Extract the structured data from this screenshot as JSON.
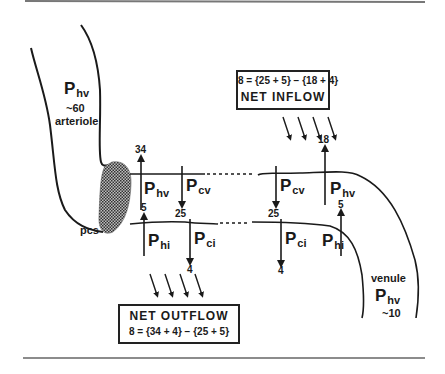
{
  "diagram": {
    "arteriole": {
      "pressure_label": "P",
      "pressure_sub": "hv",
      "value": "~60",
      "name": "arteriole"
    },
    "venule": {
      "name": "venule",
      "pressure_label": "P",
      "pressure_sub": "hv",
      "value": "~10"
    },
    "sphincter_label": "pcs",
    "arterial_end": {
      "P_hv": {
        "label": "P",
        "sub": "hv",
        "value": "34"
      },
      "P_cv": {
        "label": "P",
        "sub": "cv",
        "value": "25"
      },
      "P_hi": {
        "label": "P",
        "sub": "hi",
        "value": "5"
      },
      "P_ci": {
        "label": "P",
        "sub": "ci",
        "value": "4"
      }
    },
    "venous_end": {
      "P_cv": {
        "label": "P",
        "sub": "cv",
        "value": "25"
      },
      "P_hv": {
        "label": "P",
        "sub": "hv",
        "value": "18"
      },
      "P_ci": {
        "label": "P",
        "sub": "ci",
        "value": "4"
      },
      "P_hi": {
        "label": "P",
        "sub": "hi",
        "value": "5"
      }
    },
    "net_inflow": {
      "equation": "8 = {25 + 5} − {18 + 4}",
      "title": "NET INFLOW"
    },
    "net_outflow": {
      "title": "NET OUTFLOW",
      "equation": "8 = {34 + 4} − {25 + 5}"
    }
  }
}
